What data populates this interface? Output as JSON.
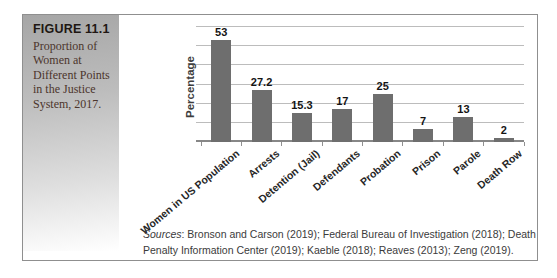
{
  "figure": {
    "label": "FIGURE 11.1",
    "caption_lines": [
      "Proportion of",
      "Women at",
      "Different Points",
      "in the Justice",
      "System, 2017."
    ]
  },
  "chart_data": {
    "type": "bar",
    "title": "",
    "categories": [
      "Women in US Population",
      "Arrests",
      "Detention (Jail)",
      "Defendants",
      "Probation",
      "Prison",
      "Parole",
      "Death Row"
    ],
    "values": [
      53,
      27.2,
      15.3,
      17,
      25,
      7,
      13,
      2
    ],
    "value_labels": [
      "53",
      "27.2",
      "15.3",
      "17",
      "25",
      "7",
      "13",
      "2"
    ],
    "xlabel": "",
    "ylabel": "Percentage",
    "ylim": [
      0,
      60
    ],
    "grid_step": 10,
    "grid": true,
    "legend_position": "none",
    "bar_color": "#6e6e6e"
  },
  "sources": {
    "prefix": "Sources",
    "line1_rest": ": Bronson and Carson (2019); Federal Bureau of Investigation (2018); Death",
    "line2": "Penalty Information Center (2019); Kaeble (2018); Reaves (2013); Zeng (2019)."
  },
  "colors": {
    "bar": "#6e6e6e",
    "gridline": "#bcbcbc",
    "axis_baseline": "#878787",
    "figure_border": "#8f8f8f",
    "figure_label_text": "#201713",
    "caption_text": "#4c352c",
    "sidebar_gray_top": "#a6a6a6"
  }
}
